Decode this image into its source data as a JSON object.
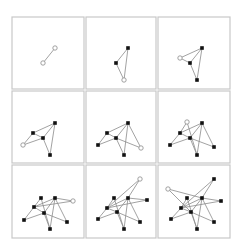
{
  "figure": {
    "title": "",
    "colors": {
      "panel_border": "#c8c8c8",
      "edge": "#8a8a8a",
      "node_filled": "#111111",
      "node_hollow_fill": "#ffffff"
    },
    "panels": [
      {
        "box": [
          12,
          17,
          72,
          72
        ],
        "nodes": [
          {
            "id": "a",
            "x": 55,
            "y": 48,
            "hollow": true
          },
          {
            "id": "b",
            "x": 43,
            "y": 63,
            "hollow": true
          }
        ],
        "edges": [
          [
            "a",
            "b"
          ]
        ]
      },
      {
        "box": [
          86,
          17,
          70,
          72
        ],
        "nodes": [
          {
            "id": "top",
            "x": 128,
            "y": 48,
            "hollow": false
          },
          {
            "id": "leftmid",
            "x": 116,
            "y": 63,
            "hollow": false
          },
          {
            "id": "bottom",
            "x": 124,
            "y": 80,
            "hollow": true
          }
        ],
        "edges": [
          [
            "top",
            "leftmid"
          ],
          [
            "top",
            "bottom"
          ],
          [
            "leftmid",
            "bottom"
          ]
        ]
      },
      {
        "box": [
          158,
          17,
          72,
          72
        ],
        "nodes": [
          {
            "id": "top",
            "x": 202,
            "y": 48,
            "hollow": false
          },
          {
            "id": "mid",
            "x": 190,
            "y": 63,
            "hollow": false
          },
          {
            "id": "bottom",
            "x": 197,
            "y": 80,
            "hollow": false
          },
          {
            "id": "new",
            "x": 180,
            "y": 58,
            "hollow": true
          }
        ],
        "edges": [
          [
            "top",
            "mid"
          ],
          [
            "top",
            "bottom"
          ],
          [
            "mid",
            "bottom"
          ],
          [
            "new",
            "top"
          ],
          [
            "new",
            "mid"
          ]
        ]
      },
      {
        "box": [
          12,
          91,
          72,
          72
        ],
        "nodes": [
          {
            "id": "top",
            "x": 55,
            "y": 123,
            "hollow": false
          },
          {
            "id": "leftmid",
            "x": 33,
            "y": 133,
            "hollow": false
          },
          {
            "id": "mid",
            "x": 43,
            "y": 138,
            "hollow": false
          },
          {
            "id": "bottom",
            "x": 50,
            "y": 155,
            "hollow": false
          },
          {
            "id": "new",
            "x": 23,
            "y": 145,
            "hollow": true
          }
        ],
        "edges": [
          [
            "top",
            "leftmid"
          ],
          [
            "top",
            "mid"
          ],
          [
            "top",
            "bottom"
          ],
          [
            "leftmid",
            "mid"
          ],
          [
            "mid",
            "bottom"
          ],
          [
            "new",
            "leftmid"
          ],
          [
            "new",
            "mid"
          ]
        ]
      },
      {
        "box": [
          86,
          91,
          70,
          72
        ],
        "nodes": [
          {
            "id": "top",
            "x": 128,
            "y": 123,
            "hollow": false
          },
          {
            "id": "leftmid",
            "x": 107,
            "y": 133,
            "hollow": false
          },
          {
            "id": "mid",
            "x": 116,
            "y": 138,
            "hollow": false
          },
          {
            "id": "bottom",
            "x": 124,
            "y": 155,
            "hollow": false
          },
          {
            "id": "left",
            "x": 98,
            "y": 145,
            "hollow": false
          },
          {
            "id": "new",
            "x": 141,
            "y": 148,
            "hollow": true
          }
        ],
        "edges": [
          [
            "top",
            "leftmid"
          ],
          [
            "top",
            "mid"
          ],
          [
            "top",
            "bottom"
          ],
          [
            "leftmid",
            "mid"
          ],
          [
            "mid",
            "bottom"
          ],
          [
            "left",
            "leftmid"
          ],
          [
            "left",
            "mid"
          ],
          [
            "new",
            "top"
          ],
          [
            "new",
            "mid"
          ]
        ]
      },
      {
        "box": [
          158,
          91,
          72,
          72
        ],
        "nodes": [
          {
            "id": "top",
            "x": 202,
            "y": 123,
            "hollow": false
          },
          {
            "id": "leftmid",
            "x": 180,
            "y": 133,
            "hollow": false
          },
          {
            "id": "mid",
            "x": 190,
            "y": 138,
            "hollow": false
          },
          {
            "id": "bottom",
            "x": 197,
            "y": 155,
            "hollow": false
          },
          {
            "id": "left",
            "x": 170,
            "y": 145,
            "hollow": false
          },
          {
            "id": "right",
            "x": 214,
            "y": 147,
            "hollow": false
          },
          {
            "id": "new",
            "x": 187,
            "y": 122,
            "hollow": true
          }
        ],
        "edges": [
          [
            "top",
            "leftmid"
          ],
          [
            "top",
            "mid"
          ],
          [
            "top",
            "bottom"
          ],
          [
            "leftmid",
            "mid"
          ],
          [
            "mid",
            "bottom"
          ],
          [
            "left",
            "leftmid"
          ],
          [
            "left",
            "mid"
          ],
          [
            "right",
            "top"
          ],
          [
            "right",
            "mid"
          ],
          [
            "new",
            "leftmid"
          ],
          [
            "new",
            "bottom"
          ]
        ]
      },
      {
        "box": [
          12,
          165,
          72,
          73
        ],
        "nodes": [
          {
            "id": "upper",
            "x": 41,
            "y": 198,
            "hollow": false
          },
          {
            "id": "top",
            "x": 55,
            "y": 198,
            "hollow": false
          },
          {
            "id": "leftmid",
            "x": 34,
            "y": 207,
            "hollow": false
          },
          {
            "id": "mid",
            "x": 44,
            "y": 213,
            "hollow": false
          },
          {
            "id": "left",
            "x": 24,
            "y": 220,
            "hollow": false
          },
          {
            "id": "right2",
            "x": 67,
            "y": 222,
            "hollow": false
          },
          {
            "id": "bottom",
            "x": 50,
            "y": 229,
            "hollow": false
          },
          {
            "id": "new",
            "x": 73,
            "y": 201,
            "hollow": true
          }
        ],
        "edges": [
          [
            "top",
            "leftmid"
          ],
          [
            "top",
            "mid"
          ],
          [
            "top",
            "bottom"
          ],
          [
            "leftmid",
            "mid"
          ],
          [
            "mid",
            "bottom"
          ],
          [
            "left",
            "leftmid"
          ],
          [
            "left",
            "mid"
          ],
          [
            "right2",
            "top"
          ],
          [
            "right2",
            "mid"
          ],
          [
            "upper",
            "leftmid"
          ],
          [
            "upper",
            "bottom"
          ],
          [
            "new",
            "top"
          ],
          [
            "new",
            "leftmid"
          ]
        ]
      },
      {
        "box": [
          86,
          165,
          70,
          73
        ],
        "nodes": [
          {
            "id": "upper",
            "x": 114,
            "y": 198,
            "hollow": false
          },
          {
            "id": "top",
            "x": 128,
            "y": 198,
            "hollow": false
          },
          {
            "id": "right",
            "x": 147,
            "y": 200,
            "hollow": false
          },
          {
            "id": "leftmid",
            "x": 107,
            "y": 208,
            "hollow": false
          },
          {
            "id": "mid",
            "x": 117,
            "y": 212,
            "hollow": false
          },
          {
            "id": "left",
            "x": 98,
            "y": 219,
            "hollow": false
          },
          {
            "id": "right2",
            "x": 140,
            "y": 222,
            "hollow": false
          },
          {
            "id": "bottom",
            "x": 124,
            "y": 229,
            "hollow": false
          },
          {
            "id": "new",
            "x": 140,
            "y": 179,
            "hollow": true
          }
        ],
        "edges": [
          [
            "top",
            "leftmid"
          ],
          [
            "top",
            "mid"
          ],
          [
            "top",
            "bottom"
          ],
          [
            "leftmid",
            "mid"
          ],
          [
            "mid",
            "bottom"
          ],
          [
            "left",
            "leftmid"
          ],
          [
            "left",
            "mid"
          ],
          [
            "right2",
            "top"
          ],
          [
            "right2",
            "mid"
          ],
          [
            "upper",
            "leftmid"
          ],
          [
            "upper",
            "bottom"
          ],
          [
            "right",
            "top"
          ],
          [
            "right",
            "leftmid"
          ],
          [
            "new",
            "leftmid"
          ],
          [
            "new",
            "top"
          ]
        ]
      },
      {
        "box": [
          158,
          165,
          72,
          73
        ],
        "nodes": [
          {
            "id": "topright",
            "x": 214,
            "y": 179,
            "hollow": false
          },
          {
            "id": "upper",
            "x": 187,
            "y": 198,
            "hollow": false
          },
          {
            "id": "top",
            "x": 202,
            "y": 198,
            "hollow": false
          },
          {
            "id": "right",
            "x": 221,
            "y": 201,
            "hollow": false
          },
          {
            "id": "leftmid",
            "x": 181,
            "y": 208,
            "hollow": false
          },
          {
            "id": "mid",
            "x": 191,
            "y": 212,
            "hollow": false
          },
          {
            "id": "left",
            "x": 171,
            "y": 219,
            "hollow": false
          },
          {
            "id": "right2",
            "x": 214,
            "y": 222,
            "hollow": false
          },
          {
            "id": "bottom",
            "x": 197,
            "y": 229,
            "hollow": false
          },
          {
            "id": "new",
            "x": 168,
            "y": 189,
            "hollow": true
          }
        ],
        "edges": [
          [
            "top",
            "leftmid"
          ],
          [
            "top",
            "mid"
          ],
          [
            "top",
            "bottom"
          ],
          [
            "leftmid",
            "mid"
          ],
          [
            "mid",
            "bottom"
          ],
          [
            "left",
            "leftmid"
          ],
          [
            "left",
            "mid"
          ],
          [
            "right2",
            "top"
          ],
          [
            "right2",
            "mid"
          ],
          [
            "upper",
            "leftmid"
          ],
          [
            "upper",
            "bottom"
          ],
          [
            "right",
            "top"
          ],
          [
            "right",
            "leftmid"
          ],
          [
            "topright",
            "leftmid"
          ],
          [
            "topright",
            "top"
          ],
          [
            "new",
            "top"
          ],
          [
            "new",
            "mid"
          ]
        ]
      }
    ]
  }
}
